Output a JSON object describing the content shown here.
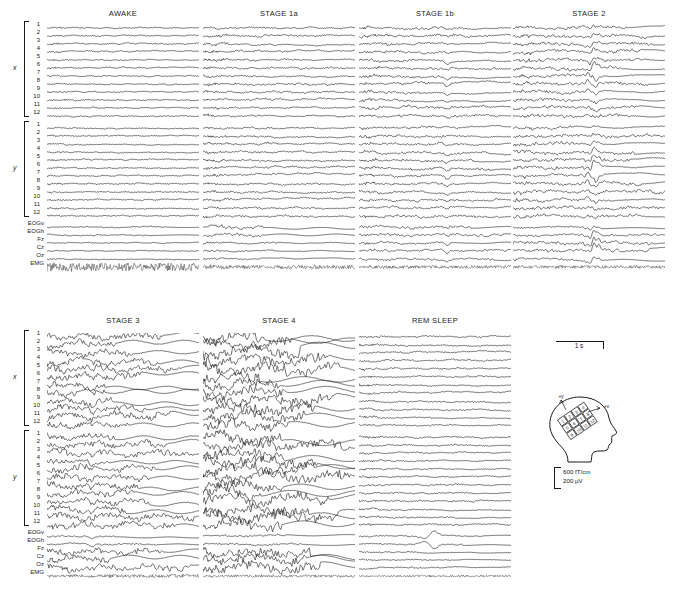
{
  "figure": {
    "type": "multi-panel-polygraphic-trace-figure",
    "background": "#ffffff",
    "ink": "#1a1a1a",
    "width": 676,
    "height": 599
  },
  "channels": {
    "group_x_label": "x",
    "group_y_label": "y",
    "x_numbers": [
      "1",
      "2",
      "3",
      "4",
      "5",
      "6",
      "7",
      "8",
      "9",
      "10",
      "11",
      "12"
    ],
    "y_numbers": [
      "1",
      "2",
      "3",
      "4",
      "5",
      "6",
      "7",
      "8",
      "9",
      "10",
      "11",
      "12"
    ],
    "aux": [
      "EOGv",
      "EOGh",
      "Fz",
      "Cz",
      "Oz",
      "EMG"
    ]
  },
  "panels": [
    {
      "id": "awake",
      "title": "AWAKE",
      "row": 0,
      "col": 0,
      "style": {
        "meg_amp": 1.25,
        "meg_freq": 9.0,
        "meg_noise": 0.95,
        "slow_amp": 0.25,
        "slow_freq": 1.1,
        "eog_amp": 0.35,
        "eeg_amp": 0.8,
        "emg_amp": 7.0,
        "emg_dense": 1.0,
        "event": "none"
      }
    },
    {
      "id": "stage1a",
      "title": "STAGE 1a",
      "row": 0,
      "col": 1,
      "style": {
        "meg_amp": 1.9,
        "meg_freq": 7.5,
        "meg_noise": 1.25,
        "slow_amp": 0.5,
        "slow_freq": 1.4,
        "eog_amp": 0.9,
        "eeg_amp": 1.0,
        "emg_amp": 3.0,
        "emg_dense": 0.9,
        "event": "none"
      }
    },
    {
      "id": "stage1b",
      "title": "STAGE 1b",
      "row": 0,
      "col": 2,
      "style": {
        "meg_amp": 1.7,
        "meg_freq": 6.5,
        "meg_noise": 1.15,
        "slow_amp": 0.7,
        "slow_freq": 1.2,
        "eog_amp": 0.8,
        "eeg_amp": 1.0,
        "emg_amp": 2.6,
        "emg_dense": 0.9,
        "event": "vertex",
        "event_pos": 0.58,
        "event_amp": 2.2
      }
    },
    {
      "id": "stage2",
      "title": "STAGE 2",
      "row": 0,
      "col": 3,
      "style": {
        "meg_amp": 1.5,
        "meg_freq": 5.0,
        "meg_noise": 0.85,
        "slow_amp": 1.0,
        "slow_freq": 1.0,
        "eog_amp": 0.6,
        "eeg_amp": 1.2,
        "emg_amp": 2.2,
        "emg_dense": 0.85,
        "event": "kcomplex",
        "event_pos": 0.52,
        "event_amp": 4.2
      }
    },
    {
      "id": "stage3",
      "title": "STAGE 3",
      "row": 1,
      "col": 0,
      "style": {
        "meg_amp": 2.0,
        "meg_freq": 3.0,
        "meg_noise": 0.7,
        "slow_amp": 2.1,
        "slow_freq": 1.5,
        "eog_amp": 0.5,
        "eeg_amp": 2.4,
        "emg_amp": 2.0,
        "emg_dense": 0.8,
        "event": "sharp",
        "event_pos": 0.3,
        "event_amp": 2.6
      }
    },
    {
      "id": "stage4",
      "title": "STAGE 4",
      "row": 1,
      "col": 1,
      "style": {
        "meg_amp": 2.4,
        "meg_freq": 2.0,
        "meg_noise": 0.6,
        "slow_amp": 3.4,
        "slow_freq": 1.1,
        "eog_amp": 0.6,
        "eeg_amp": 3.0,
        "emg_amp": 1.9,
        "emg_dense": 0.8,
        "event": "none"
      }
    },
    {
      "id": "rem",
      "title": "REM SLEEP",
      "row": 1,
      "col": 2,
      "style": {
        "meg_amp": 1.4,
        "meg_freq": 7.0,
        "meg_noise": 1.05,
        "slow_amp": 0.4,
        "slow_freq": 1.3,
        "eog_amp": 0.4,
        "eeg_amp": 0.9,
        "emg_amp": 1.4,
        "emg_dense": 0.85,
        "event": "rem_eye",
        "event_pos": 0.48,
        "event_amp": 3.2
      }
    }
  ],
  "legend": {
    "time_scale_label": "1 s",
    "amplitude_labels": [
      "600 fT/cm",
      "200 µV"
    ],
    "head_diagram": {
      "name": "head-with-sensor-array",
      "axis_labels": [
        "+y",
        "+x"
      ],
      "sensor_numbers": [
        "1",
        "2",
        "3",
        "4",
        "5",
        "6",
        "7",
        "8",
        "9",
        "10",
        "11",
        "12"
      ]
    }
  },
  "layout": {
    "panel_width": 152,
    "panel_rows": [
      {
        "top": 24,
        "title_y": 9
      },
      {
        "top": 333,
        "title_y": 316
      }
    ],
    "panel_cols": [
      47,
      203,
      359,
      513
    ],
    "row_height": 8.0,
    "gap_after_x": 4,
    "gap_after_y": 3,
    "emg_height": 18
  }
}
